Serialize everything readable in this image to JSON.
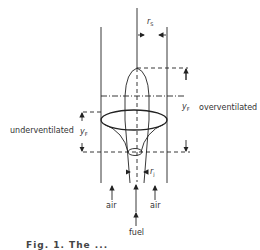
{
  "diagram": {
    "type": "flame-schematic",
    "labels": {
      "r_s": {
        "base": "r",
        "sub": "S"
      },
      "y_f_over": {
        "base": "y",
        "sub": "F"
      },
      "overventilated": "overventilated",
      "underventilated": "underventilated",
      "y_f_under": {
        "base": "y",
        "sub": "F"
      },
      "r_j": {
        "base": "r",
        "sub": "j"
      },
      "air_left": "air",
      "air_right": "air",
      "fuel": "fuel"
    },
    "caption": "Fig. 1.  The ..."
  },
  "colors": {
    "line": "#222222",
    "text": "#333333",
    "background": "#ffffff"
  }
}
